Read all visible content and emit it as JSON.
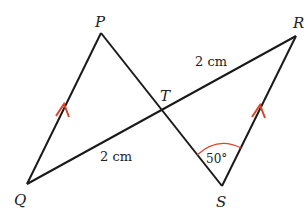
{
  "diagram": {
    "points": {
      "P": {
        "label": "P",
        "x": 101,
        "y": 33
      },
      "Q": {
        "label": "Q",
        "x": 27,
        "y": 184
      },
      "R": {
        "label": "R",
        "x": 296,
        "y": 36
      },
      "S": {
        "label": "S",
        "x": 222,
        "y": 186
      },
      "T": {
        "label": "T",
        "x": 164,
        "y": 108
      }
    },
    "lengths": {
      "TR": "2 cm",
      "QT": "2 cm"
    },
    "angle": {
      "at": "S",
      "value": "50°"
    },
    "parallel_marks": [
      "PQ",
      "RS"
    ],
    "colors": {
      "line": "#1a1a1a",
      "accent": "#d9442c"
    }
  }
}
